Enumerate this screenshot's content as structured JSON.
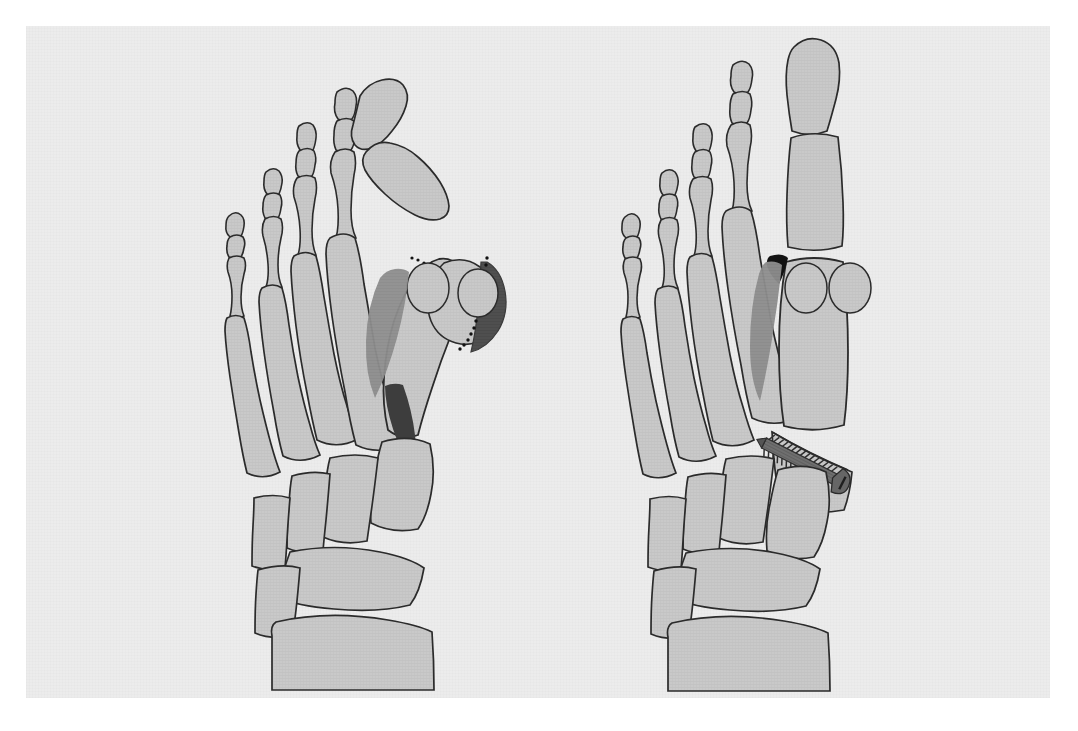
{
  "figure": {
    "domain": "medical-illustration",
    "view": "dorsal / anteroposterior view of both feet",
    "panel_count": 2,
    "page_background": "#ececec",
    "outer_background": "#ffffff",
    "caption_text": "",
    "title_text": ""
  },
  "palette": {
    "bone_fill": "#c9c9c9",
    "bone_fill_light": "#d2d2d2",
    "bone_outline": "#2b2b2b",
    "shadow_gray": "#8e8e8e",
    "wedge_dark": "#4a4a4a",
    "eminence_dark": "#555555",
    "black_wedge": "#1a1a1a",
    "screw_body": "#6e6e6e",
    "screw_dark": "#3a3a3a",
    "dotted_line": "#111111",
    "page": "#ececec",
    "paper_white": "#ffffff"
  },
  "panels": [
    {
      "id": "preoperative",
      "name": "Preoperative hallux valgus deformity",
      "side": "left",
      "label": "",
      "features": [
        "hallux valgus deviation of great toe",
        "medial eminence prominence shaded dark",
        "dotted osteotomy / resection line at medial eminence",
        "widened first intermetatarsal angle shown as dark wedge",
        "two sesamoid bones laterally displaced",
        "five metatarsals",
        "cuneiforms, navicular, cuboid",
        "talus and calcaneus cropped at bottom"
      ],
      "bone_count_visible": 26,
      "sesamoid_count": 2,
      "dotted_line_segments": 2
    },
    {
      "id": "postoperative",
      "name": "Postoperative corrected alignment with screw fixation",
      "side": "right",
      "label": "",
      "features": [
        "corrected great toe alignment, straight hallux",
        "medial eminence resected",
        "narrowed first intermetatarsal angle",
        "small residual black wedge at first web space",
        "two sesamoids relocated beneath first metatarsal head",
        "proximal first metatarsal osteotomy",
        "single oblique cortical bone screw fixation",
        "screw thread turns visible"
      ],
      "bone_count_visible": 26,
      "sesamoid_count": 2,
      "implants": [
        {
          "type": "cortical-bone-screw",
          "count": 1,
          "orientation": "oblique, proximal-medial to distal-lateral",
          "thread_turns": 17,
          "has_head": true
        }
      ]
    }
  ],
  "anatomy_labels": {
    "distal_phalanx": "Distal phalanx",
    "middle_phalanx": "Middle phalanx",
    "proximal_phalanx": "Proximal phalanx",
    "metatarsal": "Metatarsal",
    "sesamoid": "Sesamoid",
    "medial_cuneiform": "Medial cuneiform",
    "intermediate_cuneiform": "Intermediate cuneiform",
    "lateral_cuneiform": "Lateral cuneiform",
    "navicular": "Navicular",
    "cuboid": "Cuboid",
    "talus": "Talus",
    "calcaneus": "Calcaneus"
  }
}
